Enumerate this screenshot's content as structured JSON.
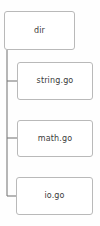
{
  "diagram": {
    "type": "tree",
    "orientation": "vertical-trunk-left",
    "root": {
      "id": "dir",
      "label": "dir"
    },
    "children": [
      {
        "id": "string-go",
        "label": "string.go"
      },
      {
        "id": "math-go",
        "label": "math.go"
      },
      {
        "id": "io-go",
        "label": "io.go"
      }
    ],
    "colors": {
      "background": "#fefefe",
      "node_fill": "#ffffff",
      "node_border": "#b9b9b9",
      "connector": "#7a7a7a",
      "text": "#3b3b3b"
    }
  }
}
